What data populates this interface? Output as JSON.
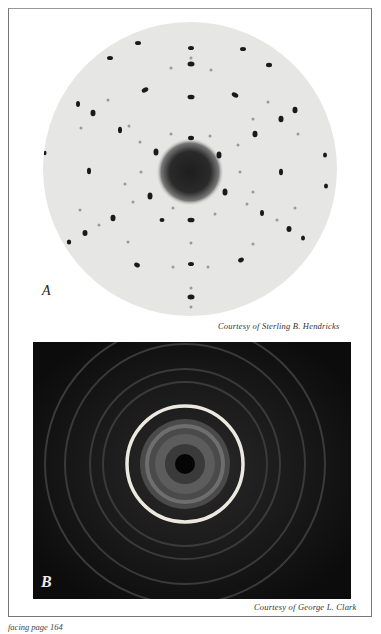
{
  "figures": [
    {
      "label": "A",
      "type": "Laue diffraction pattern (spot pattern, circular plate)",
      "credit": "Courtesy of Sterling B. Hendricks"
    },
    {
      "label": "B",
      "type": "Powder diffraction pattern (concentric rings, dark plate)",
      "credit": "Courtesy of George L. Clark"
    }
  ],
  "page_caption": "facing page 164"
}
